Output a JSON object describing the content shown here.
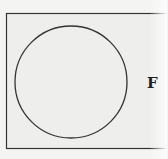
{
  "diagram": {
    "type": "venn",
    "outer_label": "F",
    "colors": {
      "background": "#f4f4f2",
      "stroke": "#333333"
    }
  }
}
